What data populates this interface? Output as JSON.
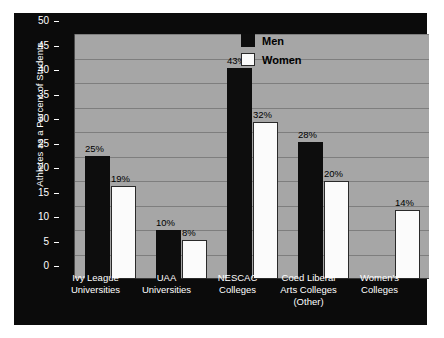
{
  "chart_data": {
    "type": "bar",
    "title": "",
    "xlabel": "",
    "ylabel": "Athletes as a Percent of Students",
    "ylim": [
      0,
      50
    ],
    "ytick_step": 5,
    "yticks": [
      "50",
      "45",
      "40",
      "35",
      "30",
      "25",
      "20",
      "15",
      "10",
      "5",
      "0"
    ],
    "grid": true,
    "legend_position": "top-right",
    "value_suffix": "%",
    "categories": [
      "Ivy League\nUniversities",
      "UAA\nUniversities",
      "NESCAC\nColleges",
      "Coed Liberal\nArts Colleges\n(Other)",
      "Women's\nColleges"
    ],
    "category_lines": [
      [
        "Ivy League",
        "Universities"
      ],
      [
        "UAA",
        "Universities"
      ],
      [
        "NESCAC",
        "Colleges"
      ],
      [
        "Coed Liberal",
        "Arts Colleges",
        "(Other)"
      ],
      [
        "Women's",
        "Colleges"
      ]
    ],
    "series": [
      {
        "name": "Men",
        "color": "#0d0d0d",
        "values": [
          25,
          10,
          43,
          28,
          null
        ],
        "labels": [
          "25%",
          "10%",
          "43%",
          "28%",
          ""
        ]
      },
      {
        "name": "Women",
        "color": "#ffffff",
        "values": [
          19,
          8,
          32,
          20,
          14
        ],
        "labels": [
          "19%",
          "8%",
          "32%",
          "20%",
          "14%"
        ]
      }
    ]
  },
  "legend": {
    "items": [
      {
        "label": "Men",
        "swatch": "men"
      },
      {
        "label": "Women",
        "swatch": "women"
      }
    ]
  },
  "axis": {
    "y_title": "Athletes as a Percent of Students"
  }
}
